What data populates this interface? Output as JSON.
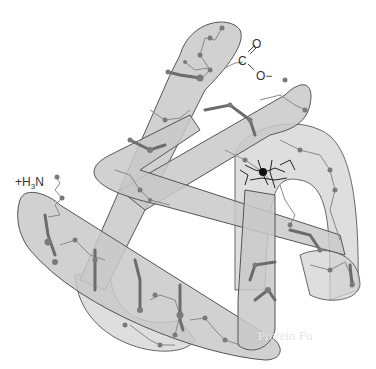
{
  "figure": {
    "labels": {
      "n_terminus_prefix": "+H",
      "n_terminus_sub": "3",
      "n_terminus_suffix": "N",
      "c_double_o": "O",
      "c_atom": "C",
      "c_o_minus": "O−"
    },
    "bleed_through_text": [
      "Protein Fu"
    ],
    "colors": {
      "tube_fill": "#c8c8c8",
      "tube_stroke": "#555555",
      "chain": "#777777",
      "node": "#7a7a7a",
      "heme": "#222222"
    }
  }
}
